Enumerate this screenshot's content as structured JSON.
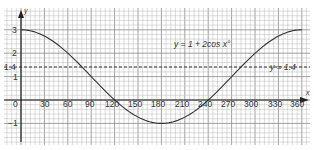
{
  "chart_data": {
    "type": "line",
    "title": "",
    "xlabel": "x",
    "ylabel": "y",
    "xlim": [
      0,
      360
    ],
    "ylim": [
      -1,
      3
    ],
    "grid": true,
    "x_ticks": [
      0,
      30,
      60,
      90,
      120,
      150,
      180,
      210,
      240,
      270,
      300,
      330,
      360
    ],
    "y_ticks": [
      "3",
      "2",
      "1.4",
      "1",
      "-1"
    ],
    "series": [
      {
        "name": "y = 1 + 2cos x°",
        "x": [
          0,
          30,
          60,
          90,
          120,
          150,
          180,
          210,
          240,
          270,
          300,
          330,
          360
        ],
        "values": [
          3,
          2.73,
          2,
          1,
          0,
          -0.73,
          -1,
          -0.73,
          0,
          1,
          2,
          2.73,
          3
        ],
        "style": "solid"
      },
      {
        "name": "y = 1.4",
        "x": [
          0,
          360
        ],
        "values": [
          1.4,
          1.4
        ],
        "style": "dashed"
      }
    ],
    "annotations": [
      "y = 1 + 2cos x°",
      "y = 1.4"
    ]
  },
  "labels": {
    "y_axis": "y",
    "x_axis": "x",
    "curve": "y = 1 + 2cos x°",
    "line": "y = 1.4",
    "origin": "0",
    "y3": "3",
    "y2": "2",
    "y14": "1.4",
    "y1": "1",
    "ym1": "−1",
    "x30": "30",
    "x60": "60",
    "x90": "90",
    "x120": "120",
    "x150": "150",
    "x180": "180",
    "x210": "210",
    "x240": "240",
    "x270": "270",
    "x300": "300",
    "x330": "330",
    "x360": "360"
  },
  "colors": {
    "grid_minor": "#b8b8b8",
    "grid_major": "#8a8a8a",
    "axis": "#222222",
    "curve": "#333333",
    "text": "#333333"
  }
}
